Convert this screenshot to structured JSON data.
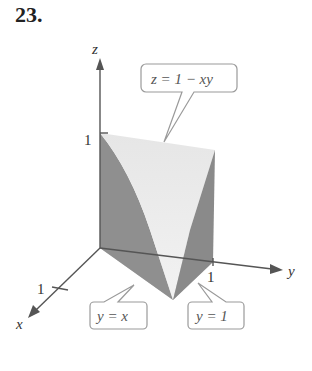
{
  "problem_number": "23.",
  "axes": {
    "x_label": "x",
    "y_label": "y",
    "z_label": "z",
    "x_tick": "1",
    "y_tick": "1",
    "z_tick": "1"
  },
  "callouts": {
    "surface": "z = 1 − xy",
    "plane_y_eq_x": "y = x",
    "plane_y_eq_1": "y = 1"
  },
  "colors": {
    "axis": "#555555",
    "dark_face": "#8c8c8c",
    "mid_face": "#a9a9a9",
    "light_face": "#e4e4e4",
    "base_face": "#b8b8b8",
    "callout_border": "#999999"
  }
}
